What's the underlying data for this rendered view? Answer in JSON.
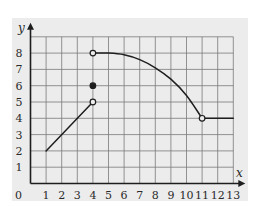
{
  "chart_data": {
    "type": "line",
    "title": "",
    "xlabel": "x",
    "ylabel": "y",
    "xlim": [
      0,
      13
    ],
    "ylim": [
      0,
      9
    ],
    "grid": true,
    "legend": null,
    "x_ticks": [
      "0",
      "1",
      "2",
      "3",
      "4",
      "5",
      "6",
      "7",
      "8",
      "9",
      "10",
      "11",
      "12",
      "13"
    ],
    "y_ticks": [
      "1",
      "2",
      "3",
      "4",
      "5",
      "6",
      "7",
      "8"
    ],
    "series": [
      {
        "name": "segment-linear",
        "kind": "line",
        "points": [
          [
            1,
            2
          ],
          [
            4,
            5
          ]
        ],
        "endpoints": {
          "start": "none",
          "end": "open"
        }
      },
      {
        "name": "isolated-point",
        "kind": "point",
        "points": [
          [
            4,
            6
          ]
        ],
        "endpoints": {
          "start": "closed"
        }
      },
      {
        "name": "segment-curve",
        "kind": "curve",
        "points": [
          [
            4,
            8
          ],
          [
            5,
            8
          ],
          [
            6,
            7.9
          ],
          [
            7,
            7.6
          ],
          [
            8,
            7.1
          ],
          [
            9,
            6.4
          ],
          [
            10,
            5.4
          ],
          [
            11,
            4
          ]
        ],
        "endpoints": {
          "start": "open",
          "end": "open"
        }
      },
      {
        "name": "segment-constant",
        "kind": "line",
        "points": [
          [
            11,
            4
          ],
          [
            13,
            4
          ]
        ],
        "endpoints": {
          "start": "none",
          "end": "none"
        }
      }
    ]
  },
  "colors": {
    "panel_background": "#ececec",
    "grid": "#7a7a7a",
    "axis": "#1e1e1e",
    "curve": "#1e1e1e"
  },
  "axes": {
    "x_label": "x",
    "y_label": "y"
  }
}
